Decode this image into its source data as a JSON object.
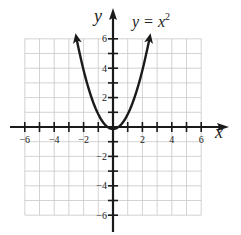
{
  "chart_data": {
    "type": "line",
    "title_base": "y = x",
    "title_exp": "2",
    "xlabel": "x",
    "ylabel": "y",
    "xlim": [
      -6,
      6
    ],
    "ylim": [
      -6,
      6
    ],
    "grid": true,
    "x_ticks": [
      -6,
      -5,
      -4,
      -3,
      -2,
      -1,
      0,
      1,
      2,
      3,
      4,
      5,
      6
    ],
    "x_tick_labels": [
      "−6",
      "−4",
      "−2",
      "2",
      "4",
      "6"
    ],
    "x_tick_label_values": [
      -6,
      -4,
      -2,
      2,
      4,
      6
    ],
    "y_tick_labels": [
      "6",
      "4",
      "2",
      "−2",
      "−4",
      "−6"
    ],
    "y_tick_label_values": [
      6,
      4,
      2,
      -2,
      -4,
      -6
    ],
    "series": [
      {
        "name": "y = x^2",
        "function": "x^2",
        "x": [
          -2.5,
          -2,
          -1.5,
          -1,
          -0.5,
          0,
          0.5,
          1,
          1.5,
          2,
          2.5
        ],
        "y": [
          6.25,
          4,
          2.25,
          1,
          0.25,
          0,
          0.25,
          1,
          2.25,
          4,
          6.25
        ],
        "arrows_at_ends": true
      }
    ]
  },
  "colors": {
    "grid": "#c8c8c8",
    "axis": "#1a1a1a",
    "curve": "#1a1a1a"
  }
}
